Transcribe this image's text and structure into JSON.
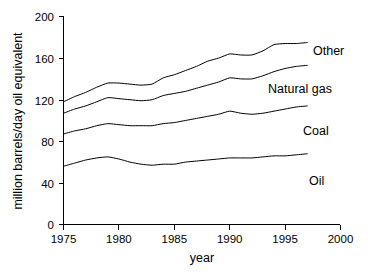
{
  "chart_data": {
    "type": "line",
    "title": "",
    "xlabel": "year",
    "ylabel": "million barrels/day oil equivalent",
    "xlim": [
      1975,
      2000
    ],
    "ylim": [
      0,
      200
    ],
    "grid": false,
    "legend_position": "inline-right-of-curves",
    "xticks": [
      "1975",
      "1980",
      "1985",
      "1990",
      "1995",
      "2000"
    ],
    "xtick_values": [
      1975,
      1980,
      1985,
      1990,
      1995,
      2000
    ],
    "yticks": [
      "0",
      "40",
      "80",
      "120",
      "160",
      "200"
    ],
    "ytick_values": [
      0,
      40,
      80,
      120,
      160,
      200
    ],
    "stacked": true,
    "note": "Cumulative stacked curves; values listed are the plotted cumulative line heights",
    "x": [
      1975,
      1976,
      1977,
      1978,
      1979,
      1980,
      1981,
      1982,
      1983,
      1984,
      1985,
      1986,
      1987,
      1988,
      1989,
      1990,
      1991,
      1992,
      1993,
      1994,
      1995,
      1996,
      1997
    ],
    "series": [
      {
        "name": "Oil",
        "label": "Oil",
        "cumulative_values": [
          56,
          59,
          62,
          64,
          65,
          63,
          60,
          58,
          57,
          58,
          58,
          60,
          61,
          62,
          63,
          64,
          64,
          64,
          65,
          66,
          66,
          67,
          68
        ]
      },
      {
        "name": "Coal",
        "label": "Coal",
        "cumulative_values": [
          87,
          90,
          92,
          95,
          97,
          96,
          95,
          95,
          95,
          97,
          98,
          100,
          102,
          104,
          106,
          109,
          107,
          106,
          107,
          109,
          111,
          113,
          114
        ]
      },
      {
        "name": "Natural gas",
        "label": "Natural gas",
        "cumulative_values": [
          107,
          111,
          114,
          118,
          122,
          121,
          120,
          119,
          120,
          124,
          126,
          128,
          131,
          134,
          137,
          141,
          140,
          140,
          143,
          147,
          150,
          152,
          153
        ]
      },
      {
        "name": "Other",
        "label": "Other",
        "cumulative_values": [
          118,
          123,
          127,
          132,
          136,
          136,
          135,
          134,
          135,
          141,
          144,
          148,
          152,
          157,
          160,
          164,
          163,
          163,
          167,
          173,
          174,
          174,
          175
        ]
      }
    ]
  },
  "labels": {
    "other": "Other",
    "natural_gas": "Natural gas",
    "coal": "Coal",
    "oil": "Oil",
    "x_axis_title": "year",
    "y_axis_title": "million barrels/day oil equivalent"
  },
  "colors": {
    "axis": "#000000",
    "curve": "#000000",
    "background": "#ffffff"
  }
}
